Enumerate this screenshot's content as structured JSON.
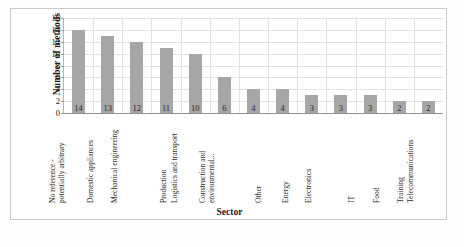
{
  "chart_data": {
    "type": "bar",
    "title": "",
    "xlabel": "Sector",
    "ylabel": "Number of methods",
    "ylim": [
      0,
      16
    ],
    "ytick_step": 2,
    "yticks": [
      16,
      14,
      12,
      10,
      8,
      6,
      4,
      2,
      0
    ],
    "grid": "both",
    "legend": "none",
    "bar_color": "#a6a6a6",
    "categories": [
      "No reference - potentially arbitrary",
      "Domestic appliances",
      "Mechanical engineering",
      "Production",
      "Logistics and transport",
      "Construction and environmental...",
      "Other",
      "Energy",
      "Electronics",
      "IT",
      "Food",
      "Training",
      "Telecommunications"
    ],
    "category_lines": [
      [
        "No reference -",
        "potentially arbitrary"
      ],
      [
        "Domestic appliances"
      ],
      [
        "Mechanical engineering"
      ],
      [
        "Production"
      ],
      [
        "Logistics and transport"
      ],
      [
        "Construction and",
        "environmental..."
      ],
      [
        "Other"
      ],
      [
        "Energy"
      ],
      [
        "Electronics"
      ],
      [
        "IT"
      ],
      [
        "Food"
      ],
      [
        "Training"
      ],
      [
        "Telecommunications"
      ]
    ],
    "values": [
      14,
      13,
      12,
      11,
      10,
      6,
      4,
      4,
      3,
      3,
      3,
      2,
      2
    ],
    "data_labels": [
      "14",
      "13",
      "12",
      "11",
      "10",
      "6",
      "4",
      "4",
      "3",
      "3",
      "3",
      "2",
      "2"
    ]
  },
  "caption": {
    "text": ""
  }
}
